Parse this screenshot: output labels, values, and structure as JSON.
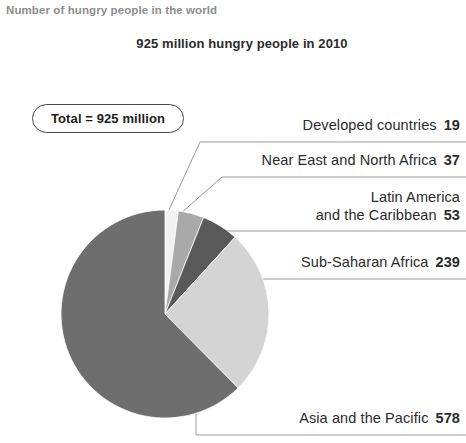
{
  "figure": {
    "supertitle": "Number of hungry people in the world",
    "title": "925 million hungry people in 2010",
    "total_badge": "Total = 925 million"
  },
  "chart_data": {
    "type": "pie",
    "title": "925 million hungry people in 2010",
    "subtitle": "Number of hungry people in the world",
    "units": "millions of people",
    "total": 925,
    "total_label": "Total = 925 million",
    "year": 2010,
    "legend_position": "callout-labels-right",
    "grid": false,
    "start_angle_deg": 0,
    "direction": "clockwise",
    "categories": [
      "Developed countries",
      "Near East and North Africa",
      "Latin America and the Caribbean",
      "Sub-Saharan Africa",
      "Asia and the Pacific"
    ],
    "values": [
      19,
      37,
      53,
      239,
      578
    ],
    "colors": [
      "#f2f2f2",
      "#a9a9a9",
      "#595959",
      "#d4d4d4",
      "#6e6e6e"
    ],
    "slices": [
      {
        "name": "Developed countries",
        "name_line1": "Developed countries",
        "name_line2": "",
        "value": 19,
        "value_text": "19",
        "percent": 2.1,
        "color": "#f2f2f2"
      },
      {
        "name": "Near East and North Africa",
        "name_line1": "Near East and North Africa",
        "name_line2": "",
        "value": 37,
        "value_text": "37",
        "percent": 4.0,
        "color": "#a9a9a9"
      },
      {
        "name": "Latin America and the Caribbean",
        "name_line1": "Latin America",
        "name_line2": "and the Caribbean",
        "value": 53,
        "value_text": "53",
        "percent": 5.7,
        "color": "#595959"
      },
      {
        "name": "Sub-Saharan Africa",
        "name_line1": "Sub-Saharan Africa",
        "name_line2": "",
        "value": 239,
        "value_text": "239",
        "percent": 25.8,
        "color": "#d4d4d4"
      },
      {
        "name": "Asia and the Pacific",
        "name_line1": "Asia and the Pacific",
        "name_line2": "",
        "value": 578,
        "value_text": "578",
        "percent": 62.5,
        "color": "#6e6e6e"
      }
    ]
  }
}
